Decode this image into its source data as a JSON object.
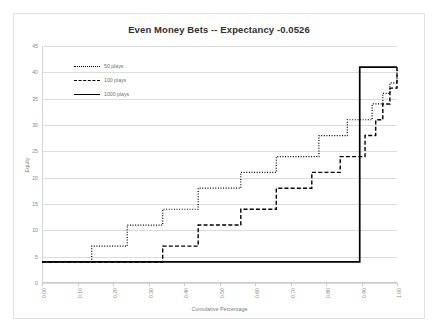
{
  "chart_data": {
    "type": "line",
    "title": "Even Money Bets -- Expectancy -0.0526",
    "xlabel": "Cumulative Percentage",
    "ylabel": "Equity",
    "xlim": [
      0.0,
      1.0
    ],
    "ylim": [
      0,
      45
    ],
    "xticks": [
      "0.00",
      "0.10",
      "0.20",
      "0.30",
      "0.40",
      "0.50",
      "0.60",
      "0.70",
      "0.80",
      "0.90",
      "1.00"
    ],
    "yticks": [
      "0",
      "5",
      "10",
      "15",
      "20",
      "25",
      "30",
      "35",
      "40",
      "45"
    ],
    "grid": "horizontal",
    "legend_position": "upper-left-inside",
    "step_shape": "post",
    "series": [
      {
        "name": "50 plays",
        "style": "dotted",
        "color": "#000000",
        "x": [
          0.0,
          0.1,
          0.14,
          0.2,
          0.24,
          0.3,
          0.34,
          0.4,
          0.44,
          0.5,
          0.56,
          0.62,
          0.66,
          0.72,
          0.78,
          0.82,
          0.86,
          0.9,
          0.93,
          0.96,
          0.98,
          1.0
        ],
        "y": [
          4,
          4,
          7,
          7,
          11,
          11,
          14,
          14,
          18,
          18,
          21,
          21,
          24,
          24,
          28,
          28,
          31,
          31,
          34,
          36,
          38,
          41
        ]
      },
      {
        "name": "100 plays",
        "style": "dashed",
        "color": "#000000",
        "x": [
          0.0,
          0.3,
          0.34,
          0.4,
          0.44,
          0.5,
          0.56,
          0.62,
          0.66,
          0.72,
          0.76,
          0.8,
          0.84,
          0.88,
          0.91,
          0.94,
          0.96,
          0.98,
          1.0
        ],
        "y": [
          4,
          4,
          7,
          7,
          11,
          11,
          14,
          14,
          18,
          18,
          21,
          21,
          24,
          24,
          28,
          31,
          34,
          37,
          41
        ]
      },
      {
        "name": "1000 plays",
        "style": "solid",
        "color": "#000000",
        "x": [
          0.0,
          0.895,
          0.895,
          1.0
        ],
        "y": [
          4,
          4,
          41,
          41
        ]
      }
    ]
  }
}
